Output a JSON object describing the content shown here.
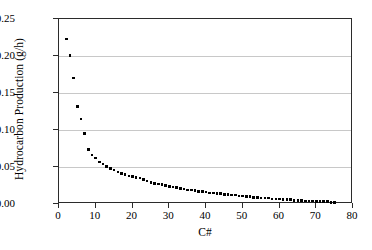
{
  "chart_data": {
    "type": "scatter",
    "title": "",
    "xlabel": "C#",
    "ylabel": "Hydrocarbon Production (g/h)",
    "xlim": [
      0,
      80
    ],
    "ylim": [
      0,
      0.25
    ],
    "xticks": [
      0,
      10,
      20,
      30,
      40,
      50,
      60,
      70,
      80
    ],
    "xtick_labels": [
      "0",
      "10",
      "20",
      "30",
      "40",
      "50",
      "60",
      "70",
      "80"
    ],
    "yticks": [
      0.0,
      0.05,
      0.1,
      0.15,
      0.2,
      0.25
    ],
    "ytick_labels": [
      "0.00",
      "0.05",
      "0.10",
      "0.15",
      "0.20",
      "0.25"
    ],
    "grid": "horizontal",
    "legend": "none",
    "marker": "square",
    "marker_color": "#000000",
    "gridline_color": "#c8c8c8",
    "axis_color": "#2b2b2b",
    "background": "#ffffff",
    "series": [
      {
        "name": "Hydrocarbon Production",
        "x": [
          2,
          3,
          4,
          5,
          6,
          7,
          8,
          9,
          10,
          11,
          12,
          13,
          14,
          15,
          16,
          17,
          18,
          19,
          20,
          21,
          22,
          23,
          24,
          25,
          26,
          27,
          28,
          29,
          30,
          31,
          32,
          33,
          34,
          35,
          36,
          37,
          38,
          39,
          40,
          41,
          42,
          43,
          44,
          45,
          46,
          47,
          48,
          49,
          50,
          51,
          52,
          53,
          54,
          55,
          56,
          57,
          58,
          59,
          60,
          61,
          62,
          63,
          64,
          65,
          66,
          67,
          68,
          69,
          70,
          71,
          72,
          73,
          74,
          75
        ],
        "y": [
          0.223,
          0.201,
          0.17,
          0.132,
          0.115,
          0.095,
          0.074,
          0.066,
          0.062,
          0.057,
          0.054,
          0.051,
          0.048,
          0.046,
          0.043,
          0.041,
          0.04,
          0.038,
          0.037,
          0.036,
          0.035,
          0.033,
          0.031,
          0.029,
          0.028,
          0.027,
          0.026,
          0.025,
          0.024,
          0.023,
          0.022,
          0.021,
          0.02,
          0.019,
          0.019,
          0.018,
          0.017,
          0.017,
          0.016,
          0.015,
          0.015,
          0.014,
          0.014,
          0.013,
          0.013,
          0.012,
          0.012,
          0.011,
          0.011,
          0.01,
          0.01,
          0.009,
          0.009,
          0.008,
          0.008,
          0.008,
          0.007,
          0.007,
          0.007,
          0.006,
          0.006,
          0.006,
          0.005,
          0.005,
          0.005,
          0.004,
          0.004,
          0.004,
          0.003,
          0.003,
          0.003,
          0.003,
          0.002,
          0.002
        ]
      }
    ]
  }
}
